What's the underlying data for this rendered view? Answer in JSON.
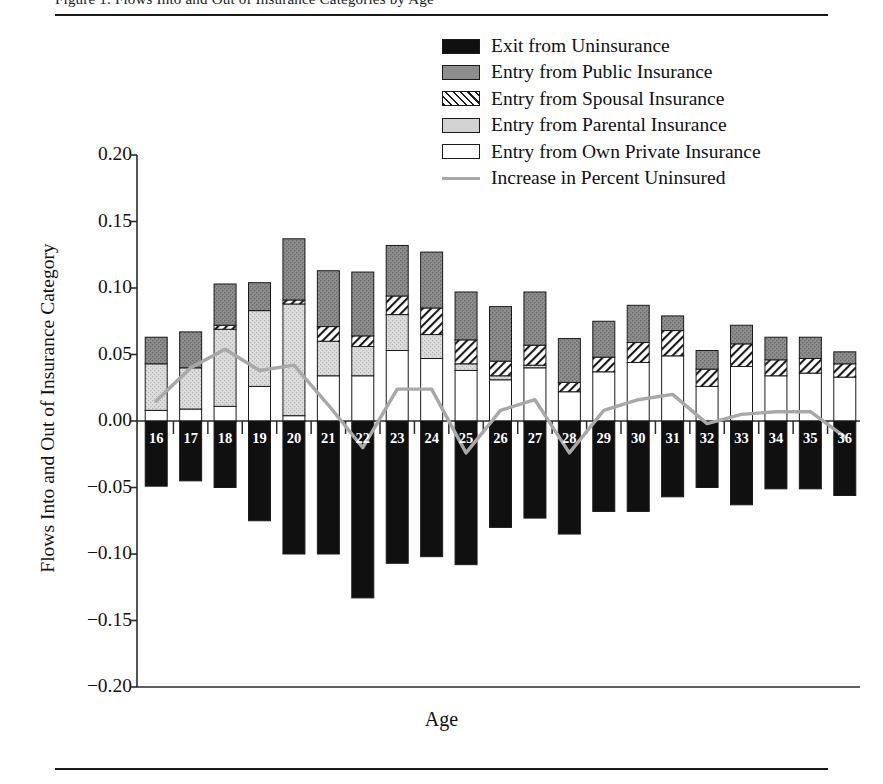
{
  "figure": {
    "clipped_header": "Figure 1.  Flows Into and Out of Insurance Categories by Age",
    "x_axis_label": "Age",
    "y_axis_label": "Flows Into and Out of Insurance Category"
  },
  "legend": {
    "items": [
      {
        "key": "exit",
        "label": "Exit from Uninsurance",
        "swatch": "exit-swatch",
        "color": "#101010"
      },
      {
        "key": "public",
        "label": "Entry from Public Insurance",
        "swatch": "public-swatch",
        "color": "#8d8d8d"
      },
      {
        "key": "spousal",
        "label": "Entry from Spousal Insurance",
        "swatch": "spousal-swatch",
        "color": "#ffffff"
      },
      {
        "key": "parental",
        "label": "Entry from Parental Insurance",
        "swatch": "parental-swatch",
        "color": "#d2d2d2"
      },
      {
        "key": "own",
        "label": "Entry from Own Private Insurance",
        "swatch": "own-swatch",
        "color": "#ffffff"
      },
      {
        "key": "line",
        "label": "Increase in Percent Uninsured",
        "swatch": "line-swatch",
        "color": "#a8a8a8"
      }
    ]
  },
  "chart_data": {
    "type": "bar",
    "title": "",
    "xlabel": "Age",
    "ylabel": "Flows Into and Out of Insurance Category",
    "ylim": [
      -0.2,
      0.2
    ],
    "yticks": [
      "0.20",
      "0.15",
      "0.10",
      "0.05",
      "0.00",
      "−0.05",
      "−0.10",
      "−0.15",
      "−0.20"
    ],
    "ytick_values": [
      0.2,
      0.15,
      0.1,
      0.05,
      0.0,
      -0.05,
      -0.1,
      -0.15,
      -0.2
    ],
    "grid": false,
    "legend_position": "top-center",
    "stacked": true,
    "categories": [
      16,
      17,
      18,
      19,
      20,
      21,
      22,
      23,
      24,
      25,
      26,
      27,
      28,
      29,
      30,
      31,
      32,
      33,
      34,
      35,
      36
    ],
    "series": [
      {
        "name": "Entry from Own Private Insurance",
        "values": [
          0.008,
          0.009,
          0.011,
          0.026,
          0.004,
          0.034,
          0.034,
          0.053,
          0.047,
          0.038,
          0.031,
          0.04,
          0.022,
          0.037,
          0.044,
          0.049,
          0.026,
          0.041,
          0.034,
          0.036,
          0.033
        ]
      },
      {
        "name": "Entry from Parental Insurance",
        "values": [
          0.035,
          0.031,
          0.058,
          0.057,
          0.084,
          0.026,
          0.022,
          0.027,
          0.018,
          0.005,
          0.003,
          0.002,
          0.0,
          0.0,
          0.0,
          0.0,
          0.0,
          0.0,
          0.0,
          0.0,
          0.0
        ]
      },
      {
        "name": "Entry from Spousal Insurance",
        "values": [
          0.0,
          0.0,
          0.003,
          0.0,
          0.003,
          0.011,
          0.008,
          0.014,
          0.02,
          0.018,
          0.011,
          0.015,
          0.007,
          0.011,
          0.015,
          0.019,
          0.013,
          0.017,
          0.012,
          0.011,
          0.01
        ]
      },
      {
        "name": "Entry from Public Insurance",
        "values": [
          0.02,
          0.027,
          0.031,
          0.021,
          0.046,
          0.042,
          0.048,
          0.038,
          0.042,
          0.036,
          0.041,
          0.04,
          0.033,
          0.027,
          0.028,
          0.011,
          0.014,
          0.014,
          0.017,
          0.016,
          0.009
        ]
      },
      {
        "name": "Exit from Uninsurance",
        "values": [
          -0.049,
          -0.045,
          -0.05,
          -0.075,
          -0.1,
          -0.1,
          -0.133,
          -0.107,
          -0.102,
          -0.108,
          -0.08,
          -0.073,
          -0.085,
          -0.068,
          -0.068,
          -0.057,
          -0.05,
          -0.063,
          -0.051,
          -0.051,
          -0.056
        ]
      }
    ],
    "line_series": {
      "name": "Increase in Percent Uninsured",
      "values": [
        0.015,
        0.04,
        0.054,
        0.038,
        0.042,
        0.012,
        -0.02,
        0.024,
        0.024,
        -0.024,
        0.008,
        0.016,
        -0.024,
        0.008,
        0.016,
        0.02,
        -0.002,
        0.005,
        0.007,
        0.007,
        -0.012
      ]
    }
  }
}
